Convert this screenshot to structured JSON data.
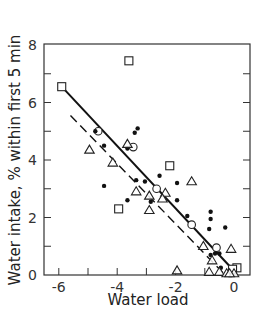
{
  "chart_data": {
    "type": "scatter",
    "title": "",
    "xlabel": "Water load",
    "ylabel": "Water intake, % within first 5 min",
    "xlim": [
      -6.5,
      0.55
    ],
    "ylim": [
      0,
      8
    ],
    "x_ticks": [
      -6,
      -4,
      -2,
      0
    ],
    "y_ticks": [
      0,
      2,
      4,
      6,
      8
    ],
    "x_minor_ticks": [
      -6,
      -5,
      -4,
      -3,
      -2,
      -1,
      0
    ],
    "y_minor_ticks": [
      1,
      3,
      5,
      7
    ],
    "grid": false,
    "legend": null,
    "series": [
      {
        "name": "open-squares",
        "marker": "square-open",
        "points": [
          [
            -5.9,
            6.55
          ],
          [
            -3.6,
            7.45
          ],
          [
            -3.95,
            2.3
          ],
          [
            -2.2,
            3.8
          ],
          [
            0.1,
            0.25
          ],
          [
            -0.05,
            0.2
          ]
        ]
      },
      {
        "name": "open-circles",
        "marker": "circle-open",
        "points": [
          [
            -4.65,
            5.0
          ],
          [
            -3.45,
            4.45
          ],
          [
            -2.65,
            3.0
          ],
          [
            -1.45,
            1.75
          ],
          [
            -0.6,
            0.95
          ]
        ]
      },
      {
        "name": "filled-dots",
        "marker": "circle-filled",
        "points": [
          [
            -4.75,
            5.0
          ],
          [
            -3.4,
            4.95
          ],
          [
            -3.3,
            5.1
          ],
          [
            -3.65,
            4.4
          ],
          [
            -4.45,
            4.5
          ],
          [
            -4.45,
            3.1
          ],
          [
            -3.35,
            3.3
          ],
          [
            -3.65,
            2.6
          ],
          [
            -3.05,
            3.25
          ],
          [
            -2.85,
            2.55
          ],
          [
            -2.55,
            3.45
          ],
          [
            -1.95,
            3.2
          ],
          [
            -1.95,
            2.6
          ],
          [
            -1.6,
            2.05
          ],
          [
            -0.8,
            2.2
          ],
          [
            -0.8,
            1.95
          ],
          [
            -0.85,
            1.6
          ],
          [
            -0.3,
            1.65
          ],
          [
            -0.8,
            0.7
          ],
          [
            -0.65,
            0.75
          ],
          [
            -0.5,
            0.75
          ],
          [
            -0.45,
            0.25
          ]
        ]
      },
      {
        "name": "open-triangles",
        "marker": "triangle-open",
        "points": [
          [
            -4.95,
            4.35
          ],
          [
            -3.65,
            4.55
          ],
          [
            -4.15,
            3.9
          ],
          [
            -3.35,
            2.9
          ],
          [
            -2.9,
            2.75
          ],
          [
            -2.9,
            2.25
          ],
          [
            -2.35,
            2.85
          ],
          [
            -2.45,
            2.65
          ],
          [
            -1.45,
            3.25
          ],
          [
            -1.05,
            1.0
          ],
          [
            -1.95,
            0.15
          ],
          [
            -0.85,
            0.1
          ],
          [
            -0.75,
            0.5
          ],
          [
            -0.5,
            0.1
          ],
          [
            -0.25,
            0.05
          ],
          [
            -0.1,
            0.9
          ],
          [
            0.0,
            0.05
          ],
          [
            -0.15,
            0.05
          ]
        ]
      }
    ],
    "regression_lines": [
      {
        "name": "solid-fit",
        "style": "solid",
        "from": [
          -5.9,
          6.55
        ],
        "to": [
          -0.05,
          0.2
        ]
      },
      {
        "name": "dashed-fit",
        "style": "dashed",
        "from": [
          -5.6,
          5.55
        ],
        "to": [
          -0.35,
          0.05
        ]
      }
    ]
  },
  "axes": {
    "xlabel": "Water load",
    "ylabel": "Water intake, % within first 5 min",
    "x_tick_labels": [
      "-6",
      "-4",
      "-2",
      "0"
    ],
    "y_tick_labels": [
      "0",
      "2",
      "4",
      "6",
      "8"
    ]
  }
}
